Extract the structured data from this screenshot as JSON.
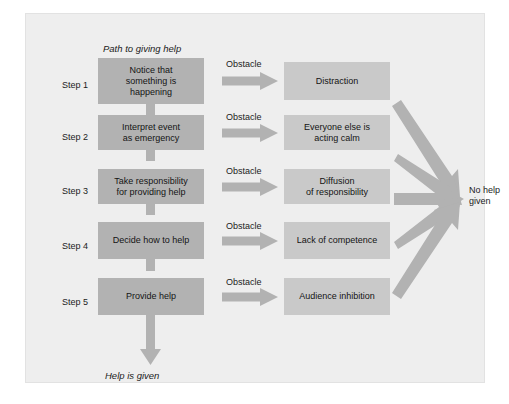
{
  "diagram": {
    "path_title": "Path to giving help",
    "outcome_title": "Help is given",
    "final_outcome": "No help\ngiven",
    "final_outcome_line1": "No help",
    "final_outcome_line2": "given",
    "colors": {
      "background": "#eeeeee",
      "step_box": "#b2b2b2",
      "obstacle_box": "#c9c9c9",
      "arrow": "#b2b2b2",
      "text": "#141414"
    },
    "rows": [
      {
        "step_label": "Step 1",
        "step_text": "Notice that something is happening",
        "step_lines": [
          "Notice that",
          "something is",
          "happening"
        ],
        "obstacle_label": "Obstacle",
        "obstacle_text": "Distraction",
        "obstacle_lines": [
          "Distraction"
        ]
      },
      {
        "step_label": "Step 2",
        "step_text": "Interpret event as emergency",
        "step_lines": [
          "Interpret event",
          "as emergency"
        ],
        "obstacle_label": "Obstacle",
        "obstacle_text": "Everyone else is acting calm",
        "obstacle_lines": [
          "Everyone else is",
          "acting calm"
        ]
      },
      {
        "step_label": "Step 3",
        "step_text": "Take responsibility for providing help",
        "step_lines": [
          "Take responsibility",
          "for providing help"
        ],
        "obstacle_label": "Obstacle",
        "obstacle_text": "Diffusion of responsibility",
        "obstacle_lines": [
          "Diffusion",
          "of responsibility"
        ]
      },
      {
        "step_label": "Step 4",
        "step_text": "Decide how to help",
        "step_lines": [
          "Decide how to help"
        ],
        "obstacle_label": "Obstacle",
        "obstacle_text": "Lack of competence",
        "obstacle_lines": [
          "Lack of competence"
        ]
      },
      {
        "step_label": "Step 5",
        "step_text": "Provide help",
        "step_lines": [
          "Provide help"
        ],
        "obstacle_label": "Obstacle",
        "obstacle_text": "Audience inhibition",
        "obstacle_lines": [
          "Audience inhibition"
        ]
      }
    ]
  }
}
